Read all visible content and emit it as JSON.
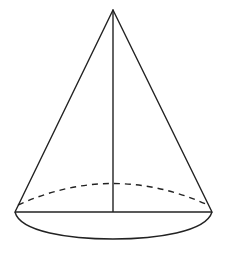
{
  "diagram": {
    "type": "cone",
    "stroke_color": "#222222",
    "background": "#ffffff",
    "apex": {
      "x": 113,
      "y": 10
    },
    "base_center": {
      "x": 113,
      "y": 212
    },
    "base_left": {
      "x": 15,
      "y": 212
    },
    "base_right": {
      "x": 212,
      "y": 212
    },
    "back_arc_peak_y": 183,
    "front_arc_bottom_y": 239,
    "elements": [
      {
        "name": "slant-edge-left",
        "style": "solid"
      },
      {
        "name": "slant-edge-right",
        "style": "solid"
      },
      {
        "name": "height-axis",
        "style": "solid"
      },
      {
        "name": "base-diameter",
        "style": "solid"
      },
      {
        "name": "base-back-arc",
        "style": "dashed"
      },
      {
        "name": "base-front-arc",
        "style": "solid"
      }
    ]
  }
}
